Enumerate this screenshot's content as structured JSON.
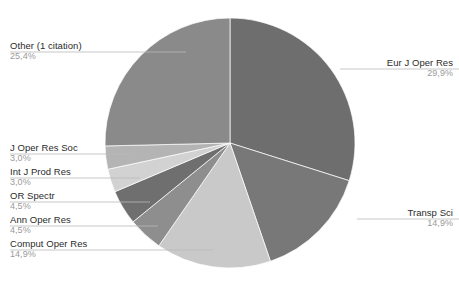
{
  "chart_data": {
    "type": "pie",
    "title": "",
    "subtitle": "",
    "xlabel": "",
    "ylabel": "",
    "legend_position": "callout-labels",
    "grid": false,
    "value_unit": "percent",
    "decimal_separator": ",",
    "total_percent": "100,1",
    "categories": [
      "Eur J Oper Res",
      "Transp Sci",
      "Comput Oper Res",
      "Ann Oper Res",
      "OR Spectr",
      "Int J Prod Res",
      "J Oper Res Soc",
      "Other (1 citation)"
    ],
    "values": [
      29.9,
      14.9,
      14.9,
      4.5,
      4.5,
      3.0,
      3.0,
      25.4
    ],
    "value_labels": [
      "29,9%",
      "14,9%",
      "14,9%",
      "4,5%",
      "4,5%",
      "3,0%",
      "3,0%",
      "25,4%"
    ],
    "colors": [
      "#6e6e6e",
      "#787878",
      "#c9c9c9",
      "#8e8e8e",
      "#6f6f6f",
      "#d2d2d2",
      "#b4b4b4",
      "#8a8a8a"
    ],
    "slices": [
      {
        "label": "Eur J Oper Res",
        "percent_label": "29,9%",
        "value": 29.9,
        "color": "#6e6e6e"
      },
      {
        "label": "Transp Sci",
        "percent_label": "14,9%",
        "value": 14.9,
        "color": "#787878"
      },
      {
        "label": "Comput Oper Res",
        "percent_label": "14,9%",
        "value": 14.9,
        "color": "#c9c9c9"
      },
      {
        "label": "Ann Oper Res",
        "percent_label": "4,5%",
        "value": 4.5,
        "color": "#8e8e8e"
      },
      {
        "label": "OR Spectr",
        "percent_label": "4,5%",
        "value": 4.5,
        "color": "#6f6f6f"
      },
      {
        "label": "Int J Prod Res",
        "percent_label": "3,0%",
        "value": 3.0,
        "color": "#d2d2d2"
      },
      {
        "label": "J Oper Res Soc",
        "percent_label": "3,0%",
        "value": 3.0,
        "color": "#b4b4b4"
      },
      {
        "label": "Other (1 citation)",
        "percent_label": "25,4%",
        "value": 25.4,
        "color": "#8a8a8a"
      }
    ]
  },
  "labels": {
    "other": {
      "name": "Other (1 citation)",
      "percent": "25,4%"
    },
    "eur_j_oper_res": {
      "name": "Eur J Oper Res",
      "percent": "29,9%"
    },
    "transp_sci": {
      "name": "Transp Sci",
      "percent": "14,9%"
    },
    "j_oper_res_soc": {
      "name": "J Oper Res Soc",
      "percent": "3,0%"
    },
    "int_j_prod_res": {
      "name": "Int J Prod Res",
      "percent": "3,0%"
    },
    "or_spectr": {
      "name": "OR Spectr",
      "percent": "4,5%"
    },
    "ann_oper_res": {
      "name": "Ann Oper Res",
      "percent": "4,5%"
    },
    "comput_oper_res": {
      "name": "Comput Oper Res",
      "percent": "14,9%"
    }
  },
  "style": {
    "background": "#ffffff",
    "label_text_color": "#2b2b2b",
    "percent_text_color": "#9a9a9a",
    "leader_line_color": "#b9b9b9"
  },
  "geometry": {
    "center_x": 230,
    "center_y": 143,
    "radius": 125,
    "start_angle_deg": -90,
    "direction": "clockwise"
  }
}
